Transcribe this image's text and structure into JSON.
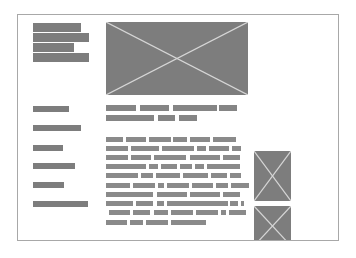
{
  "wireframe": {
    "colors": {
      "background": "#ffffff",
      "frame_border": "#a8a8a8",
      "block_fill": "#7d7d7d",
      "image_cross": "#d6d6d6"
    },
    "frame": {
      "x": 17,
      "y": 14,
      "w": 322,
      "h": 227
    },
    "title_block": {
      "icon": "redacted-text-block",
      "bars": [
        {
          "x": 33,
          "y": 23,
          "w": 48
        },
        {
          "x": 33,
          "y": 33,
          "w": 56
        },
        {
          "x": 33,
          "y": 43,
          "w": 41
        },
        {
          "x": 33,
          "y": 53,
          "w": 56
        }
      ]
    },
    "hero_image": {
      "icon": "image-placeholder-icon",
      "x": 106,
      "y": 22,
      "w": 142,
      "h": 73
    },
    "nav": {
      "items": [
        {
          "x": 33,
          "y": 106,
          "w": 36
        },
        {
          "x": 33,
          "y": 125,
          "w": 48
        },
        {
          "x": 33,
          "y": 145,
          "w": 30
        },
        {
          "x": 33,
          "y": 163,
          "w": 42
        },
        {
          "x": 33,
          "y": 182,
          "w": 31
        },
        {
          "x": 33,
          "y": 201,
          "w": 55
        }
      ]
    },
    "headline": {
      "lines": [
        {
          "y": 105,
          "words": [
            [
              106,
              30
            ],
            [
              140,
              29
            ],
            [
              173,
              44
            ],
            [
              219,
              18
            ]
          ]
        },
        {
          "y": 115,
          "words": [
            [
              106,
              48
            ],
            [
              158,
              17
            ],
            [
              179,
              18
            ]
          ]
        }
      ]
    },
    "body": {
      "lines": [
        {
          "y": 137,
          "words": [
            [
              106,
              17
            ],
            [
              126,
              20
            ],
            [
              149,
              22
            ],
            [
              173,
              14
            ],
            [
              190,
              20
            ],
            [
              213,
              23
            ]
          ]
        },
        {
          "y": 146,
          "words": [
            [
              106,
              22
            ],
            [
              131,
              28
            ],
            [
              162,
              32
            ],
            [
              197,
              9
            ],
            [
              209,
              20
            ],
            [
              232,
              9
            ]
          ]
        },
        {
          "y": 155,
          "words": [
            [
              106,
              22
            ],
            [
              131,
              20
            ],
            [
              154,
              32
            ],
            [
              190,
              30
            ],
            [
              223,
              17
            ]
          ]
        },
        {
          "y": 164,
          "words": [
            [
              106,
              40
            ],
            [
              149,
              9
            ],
            [
              161,
              16
            ],
            [
              180,
              12
            ],
            [
              195,
              9
            ],
            [
              207,
              33
            ]
          ]
        },
        {
          "y": 173,
          "words": [
            [
              106,
              32
            ],
            [
              141,
              12
            ],
            [
              156,
              24
            ],
            [
              183,
              25
            ],
            [
              211,
              16
            ],
            [
              230,
              11
            ]
          ]
        },
        {
          "y": 183,
          "words": [
            [
              106,
              24
            ],
            [
              133,
              22
            ],
            [
              158,
              6
            ],
            [
              167,
              22
            ],
            [
              192,
              21
            ],
            [
              216,
              12
            ],
            [
              231,
              18
            ]
          ]
        },
        {
          "y": 192,
          "words": [
            [
              106,
              47
            ],
            [
              157,
              30
            ],
            [
              190,
              30
            ],
            [
              223,
              17
            ]
          ]
        },
        {
          "y": 201,
          "words": [
            [
              106,
              27
            ],
            [
              136,
              17
            ],
            [
              157,
              7
            ],
            [
              167,
              61
            ],
            [
              230,
              8
            ],
            [
              241,
              3
            ]
          ]
        },
        {
          "y": 210,
          "words": [
            [
              109,
              21
            ],
            [
              133,
              17
            ],
            [
              154,
              14
            ],
            [
              171,
              22
            ],
            [
              196,
              22
            ],
            [
              221,
              5
            ],
            [
              229,
              17
            ]
          ]
        },
        {
          "y": 220,
          "words": [
            [
              106,
              21
            ],
            [
              130,
              13
            ],
            [
              146,
              22
            ],
            [
              171,
              35
            ]
          ]
        }
      ]
    },
    "side_images": [
      {
        "icon": "image-placeholder-icon",
        "x": 254,
        "y": 151,
        "w": 37,
        "h": 50
      },
      {
        "icon": "image-placeholder-icon",
        "x": 254,
        "y": 206,
        "w": 37,
        "h": 40
      }
    ]
  }
}
